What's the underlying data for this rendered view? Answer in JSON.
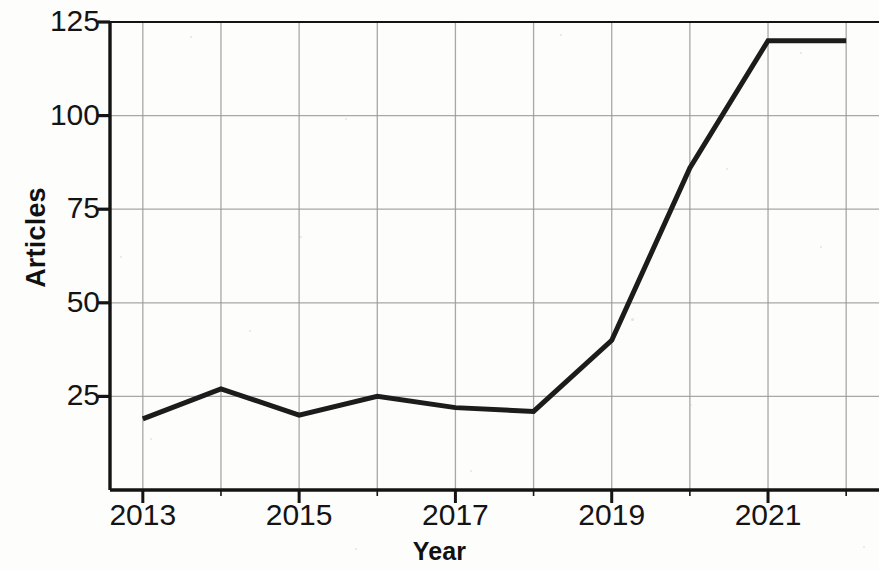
{
  "chart_data": {
    "type": "line",
    "title": "",
    "subtitle": "",
    "xlabel": "Year",
    "ylabel": "Articles",
    "x": [
      2013,
      2014,
      2015,
      2016,
      2017,
      2018,
      2019,
      2020,
      2021,
      2022
    ],
    "values": [
      19,
      27,
      20,
      25,
      22,
      21,
      40,
      86,
      120,
      120
    ],
    "series": [
      {
        "name": "Articles",
        "values": [
          19,
          27,
          20,
          25,
          22,
          21,
          40,
          86,
          120,
          120
        ]
      }
    ],
    "xlim": [
      2012.58,
      2022.42
    ],
    "ylim": [
      0,
      125
    ],
    "x_tick_values": [
      2013,
      2014,
      2015,
      2016,
      2017,
      2018,
      2019,
      2020,
      2021,
      2022
    ],
    "x_tick_labels": [
      "2013",
      "",
      "2015",
      "",
      "2017",
      "",
      "2019",
      "",
      "2021",
      ""
    ],
    "x_major_labels": [
      "2013",
      "2015",
      "2017",
      "2019",
      "2021"
    ],
    "y_ticks": [
      25,
      50,
      75,
      100,
      125
    ],
    "y_tick_labels": [
      "25",
      "50",
      "75",
      "100",
      "125"
    ],
    "grid": true,
    "grid_axis": "both",
    "legend": false,
    "legend_position": "none",
    "line_color": "#1c1c1c",
    "grid_color": "#9a9a9a",
    "axis_color": "#141414",
    "background_color": "#fdfdfb",
    "line_width": 5,
    "markers": false,
    "annotations": []
  }
}
